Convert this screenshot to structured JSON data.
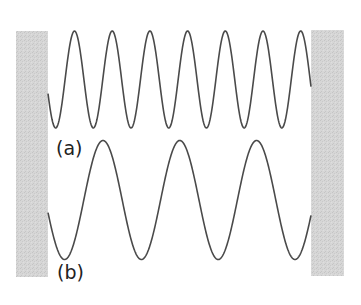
{
  "figure": {
    "type": "standing-waves-between-walls",
    "width": 361,
    "height": 305,
    "colors": {
      "background": "#ffffff",
      "wall_fill": "#d6d6d6",
      "wall_speckle": "#c4c4c4",
      "wave_stroke": "#4a4a4a",
      "label_text": "#222222"
    },
    "walls": [
      {
        "id": "left-wall",
        "x": 16,
        "y": 31,
        "width": 32,
        "height": 246
      },
      {
        "id": "right-wall",
        "x": 311,
        "y": 30,
        "width": 33,
        "height": 246
      }
    ],
    "waves": [
      {
        "id": "wave-a",
        "label": "(a)",
        "label_pos": {
          "x": 56,
          "y": 155
        },
        "x_start": 48,
        "x_end": 311,
        "center_y": 79.5,
        "amplitude": 48.5,
        "period": 37.7,
        "first_peak_x": 74.5
      },
      {
        "id": "wave-b",
        "label": "(b)",
        "label_pos": {
          "x": 57,
          "y": 279
        },
        "x_start": 48,
        "x_end": 311,
        "center_y": 200,
        "amplitude": 59.5,
        "period": 76.8,
        "first_peak_x": 103
      }
    ]
  }
}
